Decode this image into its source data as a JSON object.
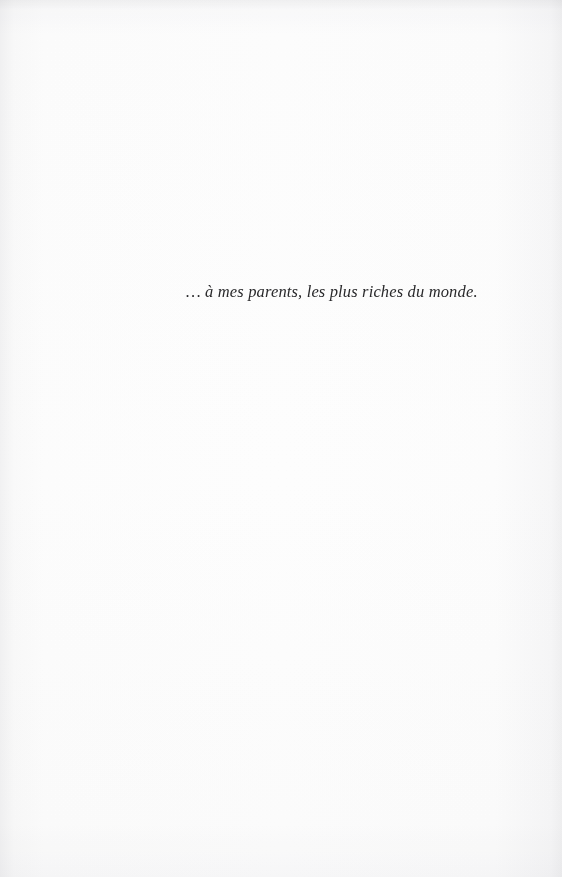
{
  "page": {
    "kind": "book-dedication-page",
    "paper_color": "#fdfdfd",
    "ink_color": "#2a2a2c"
  },
  "dedication": {
    "text": "… à mes parents, les plus riches du monde."
  }
}
